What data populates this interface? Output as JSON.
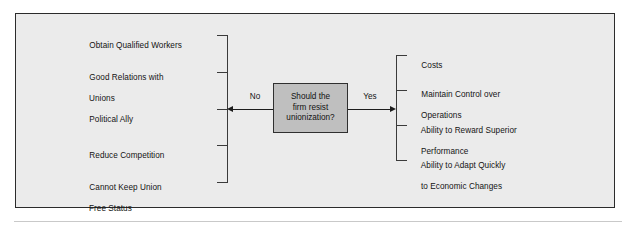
{
  "figure": {
    "decision": {
      "text": "Should the\nfirm resist\nunionization?",
      "fill_color": "#bfbfbf",
      "border_color": "#2f2f2f"
    },
    "branches": {
      "no_label": "No",
      "yes_label": "Yes"
    },
    "no_branch_items": [
      {
        "line1": "Obtain Qualified Workers",
        "line2": ""
      },
      {
        "line1": "Good Relations with",
        "line2": "Unions"
      },
      {
        "line1": "Political Ally",
        "line2": ""
      },
      {
        "line1": "Reduce Competition",
        "line2": ""
      },
      {
        "line1": "Cannot Keep Union",
        "line2": "Free Status"
      }
    ],
    "yes_branch_items": [
      {
        "line1": "Costs",
        "line2": ""
      },
      {
        "line1": "Maintain Control over",
        "line2": "Operations"
      },
      {
        "line1": "Ability to Reward Superior",
        "line2": "Performance"
      },
      {
        "line1": "Ability to Adapt Quickly",
        "line2": "to Economic Changes"
      }
    ],
    "colors": {
      "panel_background": "#ebebeb",
      "panel_border": "#2b2b2b",
      "line": "#3a3a3a",
      "text": "#131313"
    }
  }
}
